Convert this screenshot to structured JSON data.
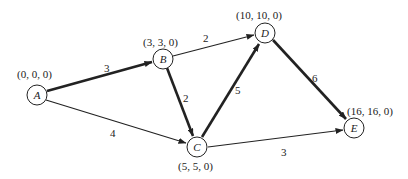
{
  "diagram": {
    "type": "activity-network",
    "nodes": [
      {
        "id": "A",
        "label": "A",
        "coords": "(0, 0, 0)"
      },
      {
        "id": "B",
        "label": "B",
        "coords": "(3, 3, 0)"
      },
      {
        "id": "C",
        "label": "C",
        "coords": "(5, 5, 0)"
      },
      {
        "id": "D",
        "label": "D",
        "coords": "(10, 10, 0)"
      },
      {
        "id": "E",
        "label": "E",
        "coords": "(16, 16, 0)"
      }
    ],
    "edges": [
      {
        "from": "A",
        "to": "B",
        "weight": "3",
        "critical": true
      },
      {
        "from": "A",
        "to": "C",
        "weight": "4",
        "critical": false
      },
      {
        "from": "B",
        "to": "D",
        "weight": "2",
        "critical": false
      },
      {
        "from": "B",
        "to": "C",
        "weight": "2",
        "critical": true
      },
      {
        "from": "C",
        "to": "D",
        "weight": "5",
        "critical": true
      },
      {
        "from": "D",
        "to": "E",
        "weight": "6",
        "critical": true
      },
      {
        "from": "C",
        "to": "E",
        "weight": "3",
        "critical": false
      }
    ]
  }
}
